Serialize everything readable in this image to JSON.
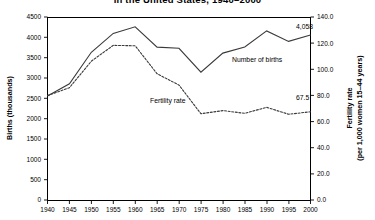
{
  "header": {
    "title": "in the United States, 1940–2000",
    "title_full": "Number of births and fertility rate in the United States, 1940–2000"
  },
  "chart_data": {
    "type": "line",
    "title": "in the United States, 1940–2000",
    "xlabel": "",
    "x": [
      1940,
      1945,
      1950,
      1955,
      1960,
      1965,
      1970,
      1975,
      1980,
      1985,
      1990,
      1995,
      2000
    ],
    "xlim": [
      1938,
      2002
    ],
    "xticks": [
      "1940",
      "1945",
      "1950",
      "1955",
      "1960",
      "1965",
      "1970",
      "1975",
      "1980",
      "1985",
      "1990",
      "1995",
      "2000"
    ],
    "grid": false,
    "legend_position": "inline-annotation",
    "axes": {
      "left": {
        "label": "Births (thousands)",
        "ylim": [
          0,
          4500
        ],
        "ticks": [
          "0",
          "500",
          "1000",
          "1500",
          "2000",
          "2500",
          "3000",
          "3500",
          "4000",
          "4500"
        ],
        "tick_values": [
          0,
          500,
          1000,
          1500,
          2000,
          2500,
          3000,
          3500,
          4000,
          4500
        ]
      },
      "right": {
        "label_line1": "Fertility rate",
        "label_line2": "(per 1,000 women 15–44 years)",
        "ylim": [
          0,
          140
        ],
        "ticks": [
          "0.0",
          "20.0",
          "40.0",
          "60.0",
          "80.0",
          "100.0",
          "120.0",
          "140.0"
        ],
        "tick_values": [
          0,
          20,
          40,
          60,
          80,
          100,
          120,
          140
        ]
      }
    },
    "series": [
      {
        "name": "Number of births",
        "axis": "left",
        "style": "solid",
        "color": "#3a3a3a",
        "label": "Number of births",
        "end_value_label": "4,058",
        "values": [
          2559,
          2858,
          3632,
          4097,
          4258,
          3760,
          3731,
          3144,
          3612,
          3761,
          4158,
          3900,
          4058
        ]
      },
      {
        "name": "Fertility rate",
        "axis": "right",
        "style": "dotted",
        "color": "#3a3a3a",
        "label": "Fertility rate",
        "end_value_label": "67.5",
        "values": [
          79.9,
          85.9,
          106.2,
          118.3,
          118.0,
          96.6,
          87.9,
          66.0,
          68.4,
          66.3,
          70.9,
          65.6,
          67.5
        ]
      }
    ],
    "annotations": [
      {
        "text": "Number of births",
        "x": 1978,
        "y_axis": "left",
        "y": 3450
      },
      {
        "text": "Fertility rate",
        "x": 1968,
        "y_axis": "right",
        "y": 62
      },
      {
        "text": "4,058",
        "x": 2000,
        "y_axis": "left",
        "y": 4290
      },
      {
        "text": "67.5",
        "x": 2000,
        "y_axis": "right",
        "y": 78
      }
    ]
  }
}
